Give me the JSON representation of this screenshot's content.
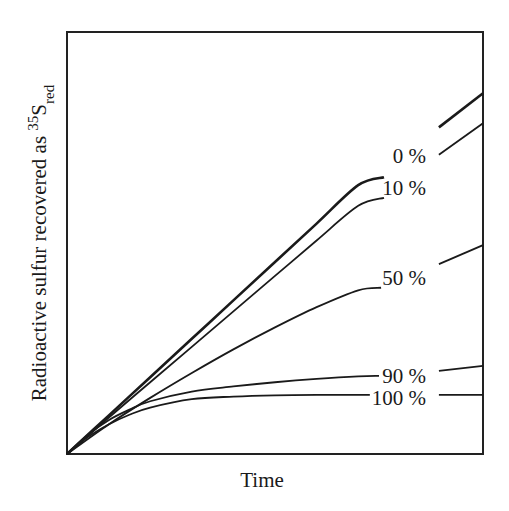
{
  "chart_data": {
    "type": "line",
    "title": "",
    "xlabel": "Time",
    "ylabel": "Radioactive sulfur recovered as 35S_red",
    "ylabel_parts": {
      "main": "Radioactive sulfur recovered as ",
      "superscript": "35",
      "base": "S",
      "subscript": "red"
    },
    "xlim": [
      0,
      100
    ],
    "ylim": [
      0,
      100
    ],
    "grid": false,
    "ticks": false,
    "legend_position": "inline-right",
    "x": [
      0,
      10,
      20,
      30,
      40,
      50,
      60,
      70,
      75,
      90,
      100
    ],
    "series": [
      {
        "name": "0 %",
        "label": "0 %",
        "stroke_width": 2.6,
        "points": [
          [
            0,
            0
          ],
          [
            10,
            9.1
          ],
          [
            20,
            18.2
          ],
          [
            30,
            27.3
          ],
          [
            40,
            36.4
          ],
          [
            50,
            45.5
          ],
          [
            60,
            54.6
          ],
          [
            70,
            63.7
          ],
          [
            76.2,
            65.6
          ]
        ],
        "tail": [
          [
            89.4,
            77.4
          ],
          [
            100,
            85.5
          ]
        ]
      },
      {
        "name": "10 %",
        "label": "10 %",
        "stroke_width": 1.8,
        "points": [
          [
            0,
            0
          ],
          [
            10,
            8.6
          ],
          [
            20,
            17.0
          ],
          [
            30,
            25.4
          ],
          [
            40,
            33.8
          ],
          [
            50,
            42.2
          ],
          [
            60,
            50.6
          ],
          [
            70,
            58.8
          ],
          [
            76.2,
            60.7
          ]
        ],
        "tail": [
          [
            89.4,
            70.9
          ],
          [
            100,
            78.4
          ]
        ]
      },
      {
        "name": "50 %",
        "label": "50 %",
        "stroke_width": 1.8,
        "points": [
          [
            0,
            0
          ],
          [
            10,
            7.0
          ],
          [
            20,
            13.3
          ],
          [
            30,
            19.2
          ],
          [
            40,
            24.8
          ],
          [
            50,
            30.0
          ],
          [
            60,
            34.8
          ],
          [
            70,
            38.8
          ],
          [
            75.5,
            39.4
          ]
        ],
        "tail": [
          [
            89.4,
            45.0
          ],
          [
            100,
            49.5
          ]
        ]
      },
      {
        "name": "90 %",
        "label": "90 %",
        "stroke_width": 1.8,
        "points": [
          [
            0,
            0
          ],
          [
            5,
            4.5
          ],
          [
            10,
            8.0
          ],
          [
            15,
            10.5
          ],
          [
            20,
            12.5
          ],
          [
            30,
            14.8
          ],
          [
            40,
            16.0
          ],
          [
            50,
            17.0
          ],
          [
            60,
            17.8
          ],
          [
            70,
            18.4
          ],
          [
            75,
            18.5
          ]
        ],
        "tail": [
          [
            89.4,
            19.7
          ],
          [
            100,
            20.9
          ]
        ]
      },
      {
        "name": "100 %",
        "label": "100 %",
        "stroke_width": 1.8,
        "points": [
          [
            0,
            0
          ],
          [
            5,
            4.0
          ],
          [
            10,
            7.0
          ],
          [
            15,
            9.3
          ],
          [
            20,
            11.0
          ],
          [
            30,
            13.0
          ],
          [
            40,
            13.6
          ],
          [
            50,
            13.9
          ],
          [
            60,
            14.0
          ],
          [
            72.8,
            14.0
          ]
        ],
        "tail": [
          [
            89.4,
            14.0
          ],
          [
            100,
            14.0
          ]
        ]
      }
    ]
  },
  "plot_area": {
    "left": 67,
    "top": 32,
    "right": 483,
    "bottom": 454
  },
  "label_positions": {
    "0 %": [
      426,
      163
    ],
    "10 %": [
      426,
      195
    ],
    "50 %": [
      426,
      285
    ],
    "90 %": [
      426,
      383
    ],
    "100 %": [
      426,
      405
    ]
  },
  "xlabel_position": [
    262,
    487
  ],
  "ylabel_position": [
    46,
    243
  ]
}
